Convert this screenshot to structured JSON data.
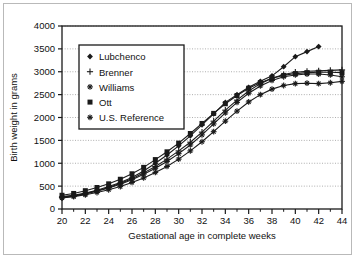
{
  "chart_data": {
    "type": "line",
    "title": "",
    "xlabel": "Gestational age in complete weeks",
    "ylabel": "Birth weight in grams",
    "xlim": [
      20,
      44
    ],
    "ylim": [
      0,
      4000
    ],
    "xticks": [
      20,
      22,
      24,
      26,
      28,
      30,
      32,
      34,
      36,
      38,
      40,
      42,
      44
    ],
    "xtick_labels": [
      "20",
      "22",
      "24",
      "26",
      "28",
      "30",
      "32",
      "34",
      "36",
      "38",
      "40",
      "42",
      "44"
    ],
    "xminor_step": 1,
    "yticks": [
      0,
      500,
      1000,
      1500,
      2000,
      2500,
      3000,
      3500,
      4000
    ],
    "ytick_labels": [
      "0",
      "500",
      "1000",
      "1500",
      "2000",
      "2500",
      "3000",
      "3500",
      "4000"
    ],
    "grid": "horizontal-dotted",
    "legend_position": "upper-left-inside",
    "x": [
      20,
      21,
      22,
      23,
      24,
      25,
      26,
      27,
      28,
      29,
      30,
      31,
      32,
      33,
      34,
      35,
      36,
      37,
      38,
      39,
      40,
      41,
      42,
      43,
      44
    ],
    "series": [
      {
        "name": "Lubchenco",
        "marker": "diamond",
        "color": "#1a1a1a",
        "x": [
          20,
          21,
          22,
          23,
          24,
          25,
          26,
          27,
          28,
          29,
          30,
          31,
          32,
          33,
          34,
          35,
          36,
          37,
          38,
          39,
          40,
          41,
          42
        ],
        "values": [
          270,
          300,
          350,
          410,
          490,
          580,
          690,
          830,
          1000,
          1180,
          1380,
          1600,
          1840,
          2080,
          2330,
          2500,
          2660,
          2790,
          2910,
          3110,
          3330,
          3440,
          3550
        ]
      },
      {
        "name": "Brenner",
        "marker": "plus",
        "color": "#1a1a1a",
        "x": [
          20,
          21,
          22,
          23,
          24,
          25,
          26,
          27,
          28,
          29,
          30,
          31,
          32,
          33,
          34,
          35,
          36,
          37,
          38,
          39,
          40,
          41,
          42,
          43,
          44
        ],
        "values": [
          260,
          290,
          340,
          400,
          470,
          560,
          660,
          790,
          930,
          1090,
          1270,
          1460,
          1680,
          1920,
          2160,
          2380,
          2580,
          2740,
          2860,
          2940,
          2990,
          3010,
          3020,
          3030,
          3040
        ]
      },
      {
        "name": "Williams",
        "marker": "star",
        "color": "#1a1a1a",
        "x": [
          20,
          21,
          22,
          23,
          24,
          25,
          26,
          27,
          28,
          29,
          30,
          31,
          32,
          33,
          34,
          35,
          36,
          37,
          38,
          39,
          40,
          41,
          42,
          43,
          44
        ],
        "values": [
          250,
          280,
          330,
          390,
          460,
          540,
          640,
          760,
          890,
          1040,
          1210,
          1400,
          1620,
          1860,
          2100,
          2330,
          2530,
          2690,
          2810,
          2890,
          2930,
          2950,
          2950,
          2930,
          2890
        ]
      },
      {
        "name": "Ott",
        "marker": "square",
        "color": "#1a1a1a",
        "x": [
          20,
          21,
          22,
          23,
          24,
          25,
          26,
          27,
          28,
          29,
          30,
          31,
          32,
          33,
          34,
          35,
          36,
          37,
          38,
          39,
          40,
          41,
          42,
          43,
          44
        ],
        "values": [
          300,
          340,
          400,
          470,
          550,
          650,
          770,
          910,
          1080,
          1250,
          1440,
          1650,
          1870,
          2090,
          2300,
          2480,
          2640,
          2760,
          2860,
          2920,
          2960,
          2980,
          2990,
          2990,
          2980
        ]
      },
      {
        "name": "U.S. Reference",
        "marker": "asterisk",
        "color": "#1a1a1a",
        "x": [
          20,
          21,
          22,
          23,
          24,
          25,
          26,
          27,
          28,
          29,
          30,
          31,
          32,
          33,
          34,
          35,
          36,
          37,
          38,
          39,
          40,
          41,
          42,
          43,
          44
        ],
        "values": [
          240,
          270,
          310,
          360,
          420,
          490,
          580,
          680,
          800,
          930,
          1090,
          1270,
          1470,
          1690,
          1920,
          2140,
          2340,
          2500,
          2620,
          2700,
          2740,
          2750,
          2740,
          2760,
          2790
        ]
      }
    ]
  },
  "legend": {
    "items": [
      {
        "label": "Lubchenco"
      },
      {
        "label": "Brenner"
      },
      {
        "label": "Williams"
      },
      {
        "label": "Ott"
      },
      {
        "label": "U.S. Reference"
      }
    ]
  }
}
